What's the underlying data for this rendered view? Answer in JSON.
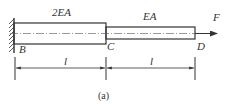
{
  "diagram": {
    "type": "stepped axial bar, fixed at left wall, axial force at free end",
    "segments": [
      {
        "name": "BC",
        "stiffness_label": "2EA",
        "length_label": "l"
      },
      {
        "name": "CD",
        "stiffness_label": "EA",
        "length_label": "l"
      }
    ],
    "points": {
      "B": "B",
      "C": "C",
      "D": "D"
    },
    "force_label": "F",
    "caption": "(a)",
    "colors": {
      "line": "#333333",
      "background": "#ffffff"
    }
  }
}
